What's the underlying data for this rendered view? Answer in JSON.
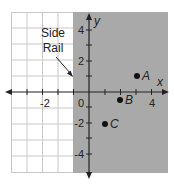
{
  "diagram": {
    "type": "coordinate-plane",
    "x_axis_label": "x",
    "y_axis_label": "y",
    "x_range": [
      -5,
      5
    ],
    "y_range": [
      -5,
      5
    ],
    "x_tick_labels": [
      "-2",
      "0",
      "4"
    ],
    "y_tick_labels": [
      "4",
      "2",
      "-2",
      "-4"
    ],
    "origin_label": "0",
    "shaded_region": {
      "from_x": -1,
      "to_x": 5,
      "color": "#a9a9a9"
    },
    "annotation": {
      "line1": "Side",
      "line2": "Rail"
    },
    "points": [
      {
        "label": "A",
        "x": 3,
        "y": 1
      },
      {
        "label": "B",
        "x": 2,
        "y": -0.5
      },
      {
        "label": "C",
        "x": 1,
        "y": -2
      }
    ],
    "colors": {
      "grid": "#c8c8c8",
      "axis": "#222222",
      "shade": "#a9a9a9",
      "point": "#111111"
    }
  }
}
